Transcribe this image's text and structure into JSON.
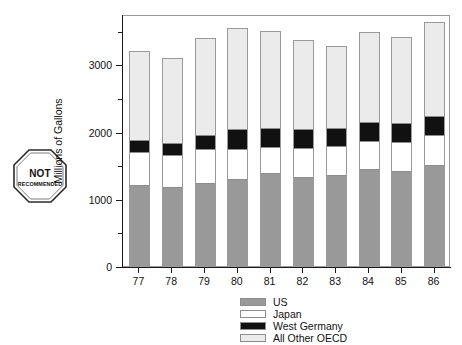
{
  "badge": {
    "line1": "NOT",
    "line2": "RECOMMENDED",
    "shape": "octagon"
  },
  "chart_data": {
    "type": "bar",
    "subtype": "stacked-vertical",
    "title": "",
    "xlabel": "",
    "ylabel": "Millions of Gallons",
    "categories": [
      "77",
      "78",
      "79",
      "80",
      "81",
      "82",
      "83",
      "84",
      "85",
      "86"
    ],
    "ylim": [
      0,
      3750
    ],
    "yticks": [
      0,
      1000,
      2000,
      3000
    ],
    "ytick_labels": [
      "0",
      "1000",
      "2000",
      "3000"
    ],
    "yminor_ticks": [
      500,
      1500,
      2500,
      3500
    ],
    "grid": false,
    "legend_position": "bottom",
    "series": [
      {
        "name": "US",
        "color": "#999999",
        "values": [
          1190,
          1160,
          1230,
          1280,
          1370,
          1320,
          1340,
          1440,
          1400,
          1500
        ]
      },
      {
        "name": "Japan",
        "color": "#ffffff",
        "values": [
          500,
          490,
          510,
          460,
          400,
          430,
          440,
          420,
          440,
          450
        ]
      },
      {
        "name": "West Germany",
        "color": "#111111",
        "values": [
          180,
          180,
          200,
          290,
          280,
          280,
          270,
          270,
          280,
          270
        ]
      },
      {
        "name": "All Other OECD",
        "color": "#ebebeb",
        "values": [
          1330,
          1270,
          1450,
          1510,
          1450,
          1340,
          1220,
          1350,
          1290,
          1410
        ]
      }
    ],
    "totals": [
      3200,
      3100,
      3390,
      3540,
      3500,
      3370,
      3270,
      3480,
      3410,
      3630
    ]
  },
  "legend": {
    "items": [
      {
        "label": "US"
      },
      {
        "label": "Japan"
      },
      {
        "label": "West Germany"
      },
      {
        "label": "All Other OECD"
      }
    ]
  }
}
